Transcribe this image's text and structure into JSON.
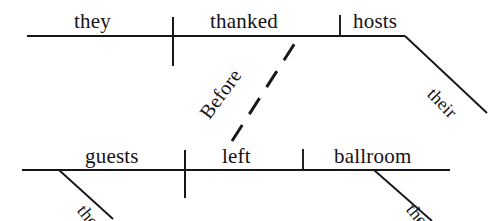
{
  "diagram": {
    "kind": "reed-kellogg-sentence-diagram",
    "sentence": "Before they thanked their hosts, the guests left the ballroom.",
    "ink_color": "#18161a",
    "background_color": "#ffffff",
    "clauses": [
      {
        "name": "subordinate-clause",
        "position": "top",
        "subject": "they",
        "verb": "thanked",
        "object": "hosts",
        "modifiers": [
          "their"
        ]
      },
      {
        "name": "main-clause",
        "position": "bottom",
        "subject": "guests",
        "verb": "left",
        "object": "ballroom",
        "modifiers": [
          "the",
          "the"
        ]
      }
    ],
    "connector": {
      "label": "Before",
      "style": "dashed-diagonal"
    },
    "words": [
      {
        "id": "they",
        "text": "they",
        "role": "subject",
        "line": "top",
        "size": "main",
        "x": 74,
        "y": 32,
        "rotate": 0
      },
      {
        "id": "thanked",
        "text": "thanked",
        "role": "verb",
        "line": "top",
        "size": "main",
        "x": 210,
        "y": 32,
        "rotate": 0
      },
      {
        "id": "hosts",
        "text": "hosts",
        "role": "direct-object",
        "line": "top",
        "size": "main",
        "x": 353,
        "y": 32,
        "rotate": 0
      },
      {
        "id": "their",
        "text": "their",
        "role": "modifier",
        "line": "top",
        "size": "mod",
        "x": 424,
        "y": 97,
        "rotate": 46
      },
      {
        "id": "before",
        "text": "Before",
        "role": "conjunction",
        "line": "connector",
        "size": "conj",
        "x": 212,
        "y": 122,
        "rotate": -54
      },
      {
        "id": "guests",
        "text": "guests",
        "role": "subject",
        "line": "bottom",
        "size": "main",
        "x": 85,
        "y": 167,
        "rotate": 0
      },
      {
        "id": "left",
        "text": "left",
        "role": "verb",
        "line": "bottom",
        "size": "main",
        "x": 222,
        "y": 167,
        "rotate": 0
      },
      {
        "id": "ballroom",
        "text": "ballroom",
        "role": "direct-object",
        "line": "bottom",
        "size": "main",
        "x": 334,
        "y": 167,
        "rotate": 0
      },
      {
        "id": "the-guests",
        "text": "the",
        "role": "modifier",
        "line": "bottom",
        "size": "mod",
        "x": 74,
        "y": 213,
        "rotate": 50
      },
      {
        "id": "the-ballroom",
        "text": "the",
        "role": "modifier",
        "line": "bottom",
        "size": "mod",
        "x": 403,
        "y": 212,
        "rotate": 50
      }
    ],
    "strokes": {
      "top_baseline": {
        "x1": 27,
        "y1": 36,
        "x2": 405,
        "y2": 36
      },
      "bottom_baseline": {
        "x1": 22,
        "y1": 170,
        "x2": 450,
        "y2": 170
      },
      "top_divider_full": {
        "x1": 173,
        "y1": 17,
        "x2": 173,
        "y2": 66
      },
      "top_divider_short": {
        "x1": 340,
        "y1": 15,
        "x2": 340,
        "y2": 36
      },
      "bot_divider_full": {
        "x1": 185,
        "y1": 150,
        "x2": 185,
        "y2": 198
      },
      "bot_divider_short": {
        "x1": 303,
        "y1": 149,
        "x2": 303,
        "y2": 170
      },
      "slant_their": {
        "x1": 405,
        "y1": 36,
        "x2": 487,
        "y2": 113
      },
      "slant_the_guests": {
        "x1": 59,
        "y1": 170,
        "x2": 113,
        "y2": 219
      },
      "slant_the_ball": {
        "x1": 374,
        "y1": 170,
        "x2": 432,
        "y2": 221
      },
      "conjunction_line": {
        "x1": 232,
        "y1": 141,
        "x2": 295,
        "y2": 43
      }
    }
  }
}
